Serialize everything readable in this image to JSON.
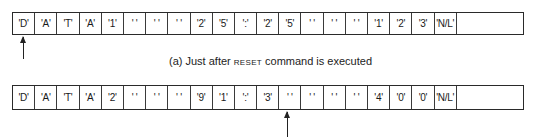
{
  "figure": {
    "buffer_a": {
      "cells": [
        "'D'",
        "'A'",
        "'T'",
        "'A'",
        "'1'",
        "' '",
        "' '",
        "' '",
        "'2'",
        "'5'",
        "':'",
        "'2'",
        "'5'",
        "' '",
        "' '",
        "' '",
        "'1'",
        "'2'",
        "'3'",
        "'N/L'"
      ],
      "pointer_index": 0
    },
    "caption_a": {
      "prefix": "(a) Just after ",
      "command": "RESET",
      "suffix": " command is executed"
    },
    "buffer_b": {
      "cells": [
        "'D'",
        "'A'",
        "'T'",
        "'A'",
        "'2'",
        "' '",
        "' '",
        "' '",
        "'9'",
        "'1'",
        "':'",
        "'3'",
        "' '",
        "' '",
        "' '",
        "' '",
        "'4'",
        "'0'",
        "'0'",
        "'N/L'"
      ],
      "pointer_index": 13
    }
  }
}
